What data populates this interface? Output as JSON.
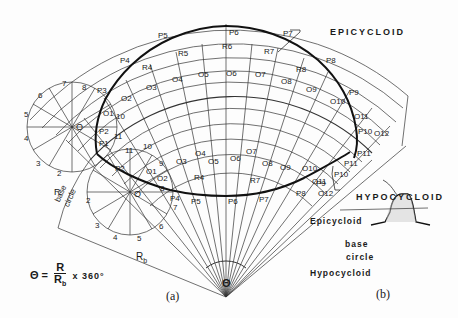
{
  "figure": {
    "panel_a": {
      "caption": "(a)",
      "labels": {
        "epicycloid": "EPICYCLOID",
        "hypocycloid": "HYPOCYCLOID",
        "base_circle_1": "base",
        "base_circle_2": "circle",
        "rolling_radius": "R",
        "base_radius": "R",
        "base_radius_sub": "b",
        "angle": "Θ",
        "center_epi": "O",
        "center_hypo": "O"
      },
      "formula": {
        "lhs": "Θ =",
        "num": "R",
        "den": "R",
        "den_sub": "b",
        "rhs": "x 360°"
      },
      "epi_points": [
        "P1",
        "P2",
        "P3",
        "P4",
        "P5",
        "P6",
        "P7",
        "P8",
        "P9",
        "P10",
        "P11"
      ],
      "epi_centers": [
        "O1",
        "O2",
        "O3",
        "O4",
        "O5",
        "O6",
        "O7",
        "O8",
        "O9",
        "O10",
        "O11",
        "O12"
      ],
      "epi_radii": [
        "R4",
        "R5",
        "R6",
        "R7",
        "R8"
      ],
      "hypo_points": [
        "P1",
        "P2",
        "P4",
        "P5",
        "P6",
        "P7",
        "P8",
        "P9",
        "P10",
        "P11",
        "P12"
      ],
      "hypo_centers": [
        "O1",
        "O2",
        "O3",
        "O4",
        "O5",
        "O6",
        "O7",
        "O8",
        "O9",
        "O10",
        "O11",
        "O12"
      ],
      "hypo_radii": [
        "R4",
        "R7"
      ],
      "circle_divisions_epi": [
        "1",
        "2",
        "3",
        "4",
        "5",
        "6",
        "7",
        "8",
        "9",
        "10",
        "11"
      ],
      "circle_divisions_hypo": [
        "1",
        "2",
        "3",
        "4",
        "5",
        "6",
        "7",
        "8",
        "9",
        "10",
        "11"
      ]
    },
    "panel_b": {
      "caption": "(b)",
      "epicycloid": "Epicycloid",
      "base_1": "base",
      "base_2": "circle",
      "hypocycloid": "Hypocycloid"
    }
  }
}
